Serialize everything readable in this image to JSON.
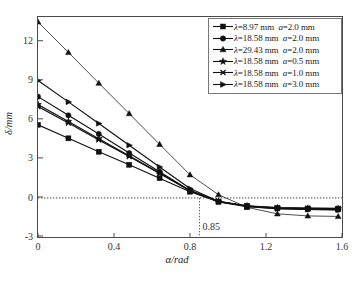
{
  "chart_data": {
    "type": "line",
    "title": "",
    "xlabel": "α/rad",
    "ylabel": "δ/mm",
    "xlim": [
      0,
      1.6
    ],
    "ylim": [
      -3,
      13.9
    ],
    "xticks": [
      "0",
      "0.4",
      "0.8",
      "1.2",
      "1.6"
    ],
    "xtick_values": [
      0,
      0.4,
      0.8,
      1.2,
      1.6
    ],
    "yticks": [
      "-3",
      "0",
      "3",
      "6",
      "9",
      "12"
    ],
    "ytick_values": [
      -3,
      0,
      3,
      6,
      9,
      12
    ],
    "grid": false,
    "legend_position": "top-right",
    "annotations": [
      {
        "text": "0.85",
        "x": 0.85,
        "note": "vertical dotted line at zero crossing"
      }
    ],
    "reference_lines": [
      {
        "orientation": "horizontal",
        "value": 0,
        "style": "dotted"
      },
      {
        "orientation": "vertical",
        "value": 0.85,
        "style": "dotted"
      }
    ],
    "x": [
      0,
      0.16,
      0.32,
      0.48,
      0.64,
      0.8,
      0.95,
      1.1,
      1.26,
      1.42,
      1.58
    ],
    "series": [
      {
        "name": "λ=8.97 mm  a=2.0 mm",
        "lambda": "8.97",
        "a": "2.0",
        "marker": "square",
        "values": [
          5.62,
          4.58,
          3.55,
          2.55,
          1.52,
          0.48,
          -0.28,
          -0.62,
          -0.78,
          -0.82,
          -0.84
        ]
      },
      {
        "name": "λ=18.58 mm a=2.0 mm",
        "lambda": "18.58",
        "a": "2.0",
        "marker": "circle",
        "values": [
          7.78,
          6.35,
          4.92,
          3.45,
          2.02,
          0.58,
          -0.3,
          -0.68,
          -0.82,
          -0.88,
          -0.9
        ]
      },
      {
        "name": "λ=29.43 mm a=2.0 mm",
        "lambda": "29.43",
        "a": "2.0",
        "marker": "triangle",
        "values": [
          13.52,
          11.18,
          8.82,
          6.48,
          4.12,
          1.78,
          0.25,
          -0.72,
          -1.22,
          -1.38,
          -1.42
        ]
      },
      {
        "name": "λ=18.58 mm a=0.5 mm",
        "lambda": "18.58",
        "a": "0.5",
        "marker": "star",
        "values": [
          7.18,
          5.88,
          4.55,
          3.25,
          1.92,
          0.55,
          -0.28,
          -0.62,
          -0.76,
          -0.8,
          -0.82
        ]
      },
      {
        "name": "λ=18.58 mm a=1.0 mm",
        "lambda": "18.58",
        "a": "1.0",
        "marker": "cross",
        "values": [
          7.02,
          5.75,
          4.45,
          3.18,
          1.88,
          0.55,
          -0.26,
          -0.6,
          -0.74,
          -0.78,
          -0.8
        ]
      },
      {
        "name": "λ=18.58 mm a=3.0 mm",
        "lambda": "18.58",
        "a": "3.0",
        "marker": "arrow",
        "values": [
          9.02,
          7.38,
          5.72,
          4.05,
          2.38,
          0.72,
          -0.25,
          -0.65,
          -0.82,
          -0.88,
          -0.92
        ]
      }
    ]
  },
  "legend": {
    "rows": [
      {
        "marker": "square",
        "lam": "λ",
        "lam_val": "=8.97 mm",
        "a": "a",
        "a_val": "=2.0 mm"
      },
      {
        "marker": "circle",
        "lam": "λ",
        "lam_val": "=18.58 mm",
        "a": "a",
        "a_val": "=2.0 mm"
      },
      {
        "marker": "triangle",
        "lam": "λ",
        "lam_val": "=29.43 mm",
        "a": "a",
        "a_val": "=2.0 mm"
      },
      {
        "marker": "star",
        "lam": "λ",
        "lam_val": "=18.58 mm",
        "a": "a",
        "a_val": "=0.5 mm"
      },
      {
        "marker": "cross",
        "lam": "λ",
        "lam_val": "=18.58 mm",
        "a": "a",
        "a_val": "=1.0 mm"
      },
      {
        "marker": "arrow",
        "lam": "λ",
        "lam_val": "=18.58 mm",
        "a": "a",
        "a_val": "=3.0 mm"
      }
    ]
  },
  "colors": {
    "line": "#111111",
    "axis": "#4a4a4a",
    "text": "#222222",
    "background": "#ffffff"
  }
}
